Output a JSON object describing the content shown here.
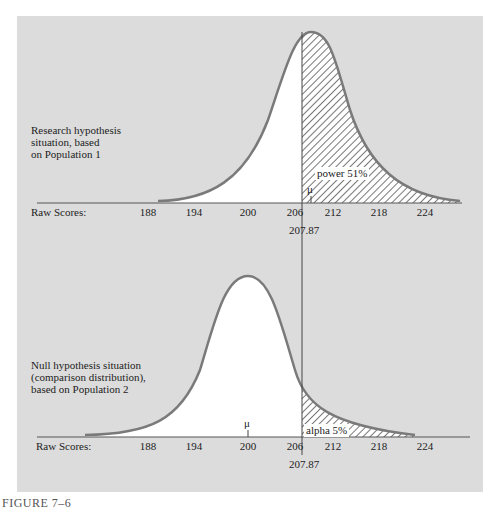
{
  "figure_caption": "FIGURE 7–6",
  "top_panel": {
    "description_lines": [
      "Research hypothesis",
      "situation, based",
      "on Population 1"
    ],
    "axis_label": "Raw Scores:",
    "ticks": [
      "188",
      "194",
      "200",
      "206",
      "212",
      "218",
      "224"
    ],
    "cutoff_label": "207.87",
    "mean_symbol": "μ",
    "shaded_label": "power 51%"
  },
  "bottom_panel": {
    "description_lines": [
      "Null hypothesis situation",
      "(comparison distribution),",
      "based on Population 2"
    ],
    "axis_label": "Raw Scores:",
    "ticks": [
      "188",
      "194",
      "200",
      "206",
      "212",
      "218",
      "224"
    ],
    "cutoff_label": "207.87",
    "mean_symbol": "μ",
    "shaded_label": "alpha 5%"
  },
  "colors": {
    "panel": "#dcdcdc",
    "curve": "#7a7a7a",
    "hatch": "#555555"
  }
}
